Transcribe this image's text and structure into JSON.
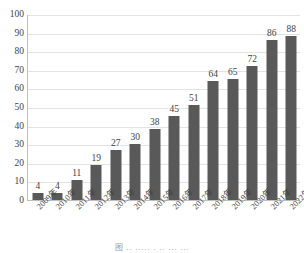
{
  "chart_data": {
    "type": "bar",
    "title": "",
    "xlabel": "",
    "ylabel": "",
    "categories": [
      "2009年",
      "2010年",
      "2011年",
      "2012年",
      "2013年",
      "2014年",
      "2015年",
      "2016年",
      "2017年",
      "2018年",
      "2019年",
      "2020年",
      "2021年",
      "2022年"
    ],
    "values": [
      4,
      4,
      11,
      19,
      27,
      30,
      38,
      45,
      51,
      64,
      65,
      72,
      86,
      88
    ],
    "ylim": [
      0,
      100
    ],
    "ytick_labels": [
      "0",
      "10",
      "20",
      "30",
      "40",
      "50",
      "60",
      "70",
      "80",
      "90",
      "100"
    ],
    "ytick_values": [
      0,
      10,
      20,
      30,
      40,
      50,
      60,
      70,
      80,
      90,
      100
    ],
    "grid": true,
    "legend": null,
    "bar_color": "#595959",
    "gridline_color": "#e3e3e3",
    "axis_color": "#bfbfbf",
    "data_labels": [
      "4",
      "4",
      "11",
      "19",
      "27",
      "30",
      "38",
      "45",
      "51",
      "64",
      "65",
      "72",
      "86",
      "88"
    ],
    "caption": "图 ..  .....  .  .. ... ..."
  }
}
